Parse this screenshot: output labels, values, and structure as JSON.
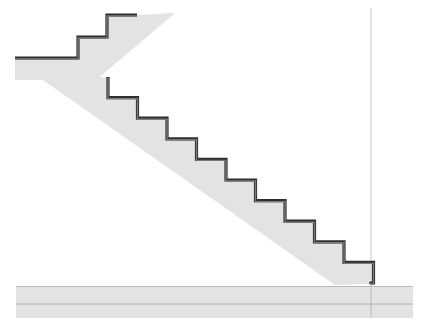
{
  "diagram": {
    "type": "stair-section",
    "colors": {
      "background": "#ffffff",
      "concrete_fill": "#e3e3e3",
      "nosing_dark": "#2e2e2e",
      "nosing_mid": "#7a7a7a",
      "guide_line": "#c8c8c8",
      "slab_line": "#b0b0b0"
    },
    "upper_flight": {
      "treads": [
        {
          "x1": 78,
          "x2": 107,
          "y": 37
        },
        {
          "x1": 107,
          "x2": 137,
          "y": 15
        }
      ],
      "landing": {
        "x1": 15,
        "x2": 78,
        "y_top": 58,
        "y_bottom": 80
      },
      "soffit_top_right": {
        "x": 175,
        "y": 13
      }
    },
    "lower_flight": {
      "start": {
        "x": 90,
        "y": 77
      },
      "step_run": 29.5,
      "step_rise": 20.6,
      "step_count": 10,
      "end_riser": {
        "x": 371,
        "y_bottom": 284
      },
      "soffit_start": {
        "x": 43,
        "y": 80
      },
      "soffit_end": {
        "x": 335,
        "y": 285
      }
    },
    "floor_slab": {
      "x1": 16,
      "x2": 413,
      "y_top": 286,
      "y_mid": 304,
      "y_bottom": 318
    },
    "vertical_guide": {
      "x": 371,
      "y1": 8,
      "y2": 318
    }
  }
}
